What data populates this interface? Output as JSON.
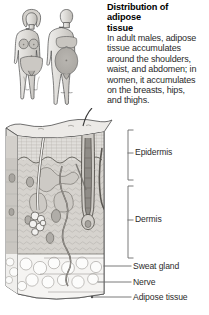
{
  "figure": {
    "title": "Distribution of adipose tissue",
    "title_lines": [
      "Distribution of",
      "adipose",
      "tissue"
    ],
    "description": "In adult males, adipose tissue accumulates around the shoulders, waist, and abdomen; in women, it accumulates on the breasts, hips, and thighs.",
    "body_lines": [
      "In adult males, adipose",
      "tissue accumulates",
      "around the shoulders,",
      "waist, and abdomen; in",
      "women, it accumulates",
      "on the breasts, hips,",
      "and thighs."
    ]
  },
  "body_figures": {
    "name": "human-body-figures",
    "female_label": "female figure",
    "male_label": "male figure"
  },
  "skin_diagram": {
    "name": "skin-cross-section-block",
    "layers": [
      "Epidermis",
      "Dermis",
      "Adipose tissue"
    ],
    "structures": [
      "hair shaft",
      "hair follicle",
      "sweat gland",
      "nerve",
      "fat cells",
      "blood vessel"
    ]
  },
  "labels": {
    "epidermis": "Epidermis",
    "dermis": "Dermis",
    "sweat_gland": "Sweat gland",
    "nerve": "Nerve",
    "adipose_tissue": "Adipose tissue"
  },
  "colors": {
    "background": "#ffffff",
    "ink": "#1b1b1b",
    "label_text": "#2c2c2c",
    "leader_line": "#6b6b6b",
    "skin_light": "#e9e8e6",
    "skin_mid": "#cfcdc9",
    "skin_dark": "#b4b1ac",
    "fat_layer": "#f4f3f1",
    "figure_fill": "#dedcd8",
    "figure_shade": "#b9b6b1"
  }
}
